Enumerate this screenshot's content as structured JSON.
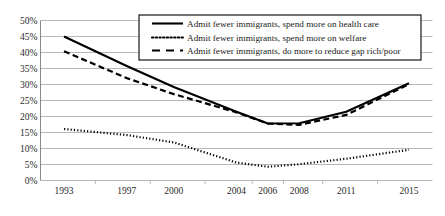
{
  "chart_data": {
    "type": "line",
    "title": "",
    "subtitle": "",
    "xlabel": "",
    "ylabel": "",
    "x": [
      1993,
      1997,
      2000,
      2004,
      2006,
      2008,
      2011,
      2015
    ],
    "categories": [
      "1993",
      "1997",
      "2000",
      "2004",
      "2006",
      "2008",
      "2011",
      "2015"
    ],
    "xlim": [
      1991.5,
      2016.5
    ],
    "ylim": [
      0,
      50
    ],
    "y_ticks": [
      0,
      5,
      10,
      15,
      20,
      25,
      30,
      35,
      40,
      45,
      50
    ],
    "y_tick_labels": [
      "0%",
      "5%",
      "10%",
      "15%",
      "20%",
      "25%",
      "30%",
      "35%",
      "40%",
      "45%",
      "50%"
    ],
    "grid": "horizontal",
    "legend_position": "top-center",
    "series": [
      {
        "name": "Admit fewer immigrants, spend more on health care",
        "style": "solid",
        "color": "#000000",
        "values": [
          45.0,
          35.8,
          29.2,
          21.5,
          17.8,
          17.9,
          21.5,
          30.4
        ]
      },
      {
        "name": "Admit fewer immigrants, spend more on welfare",
        "style": "dotted",
        "color": "#000000",
        "values": [
          16.1,
          14.2,
          11.9,
          5.6,
          4.3,
          5.1,
          6.8,
          9.6
        ]
      },
      {
        "name": "Admit fewer immigrants, do more to reduce gap rich/poor",
        "style": "dashed",
        "color": "#000000",
        "values": [
          40.4,
          32.0,
          27.0,
          21.3,
          17.8,
          17.4,
          20.5,
          30.1
        ]
      }
    ]
  },
  "legend": {
    "entries": [
      "Admit fewer immigrants, spend more on health care",
      "Admit fewer immigrants, spend more on welfare",
      "Admit fewer immigrants, do more to reduce gap rich/poor"
    ]
  }
}
